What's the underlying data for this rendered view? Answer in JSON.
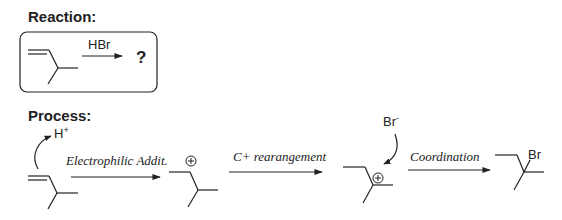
{
  "reaction": {
    "heading": "Reaction:",
    "reagent": "HBr",
    "product_unknown": "?"
  },
  "process": {
    "heading": "Process:",
    "proton": "H",
    "proton_charge": "+",
    "bromide": "Br",
    "bromide_charge": "-",
    "steps": [
      {
        "label": "Electrophilic Addit."
      },
      {
        "label": "C+ rearangement"
      },
      {
        "label": "Coordination"
      }
    ],
    "product_substituent": "Br"
  },
  "colors": {
    "ink": "#222222",
    "background": "#ffffff"
  }
}
